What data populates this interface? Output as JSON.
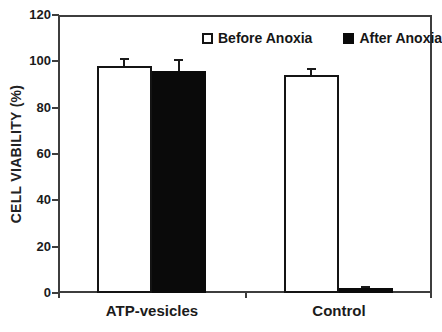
{
  "figure": {
    "background_color": "#ffffff",
    "axis_color": "#3d3d3d",
    "text_color": "#1b1b1b"
  },
  "chart_data": {
    "type": "bar",
    "title": "",
    "xlabel": "",
    "ylabel": "CELL VIABILITY (%)",
    "categories": [
      "ATP-vesicles",
      "Control"
    ],
    "series": [
      {
        "name": "Before Anoxia",
        "values": [
          98,
          94
        ],
        "errors": [
          3,
          2.5
        ],
        "fill": "#ffffff",
        "outline": "#141414"
      },
      {
        "name": "After Anoxia",
        "values": [
          96,
          2
        ],
        "errors": [
          4.5,
          0.8
        ],
        "fill": "#0a0a0a",
        "outline": "#0a0a0a"
      }
    ],
    "ylim": [
      0,
      120
    ],
    "yticks": [
      0,
      20,
      40,
      60,
      80,
      100,
      120
    ],
    "grid": false,
    "legend_position": "top-inside",
    "error_bars": "upper"
  }
}
